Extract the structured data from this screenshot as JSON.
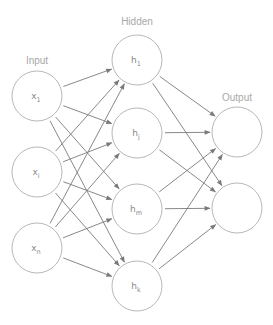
{
  "diagram": {
    "type": "neural-network",
    "colors": {
      "node_stroke": "#b8b8b8",
      "edge": "#7a7a7a",
      "label": "#a8a8a8"
    },
    "layers": [
      {
        "label": "Input",
        "label_pos": [
          37,
          64
        ],
        "nodes": [
          {
            "id": "x1",
            "base": "x",
            "sub": "1",
            "cx": 37,
            "cy": 96
          },
          {
            "id": "xi",
            "base": "x",
            "sub": "i",
            "cx": 37,
            "cy": 172
          },
          {
            "id": "xn",
            "base": "x",
            "sub": "n",
            "cx": 37,
            "cy": 248
          }
        ]
      },
      {
        "label": "Hidden",
        "label_pos": [
          137,
          25
        ],
        "nodes": [
          {
            "id": "h1",
            "base": "h",
            "sub": "1",
            "cx": 137,
            "cy": 60
          },
          {
            "id": "hj",
            "base": "h",
            "sub": "j",
            "cx": 137,
            "cy": 133
          },
          {
            "id": "hm",
            "base": "h",
            "sub": "m",
            "cx": 137,
            "cy": 209
          },
          {
            "id": "hk",
            "base": "h",
            "sub": "k",
            "cx": 137,
            "cy": 286
          }
        ]
      },
      {
        "label": "Output",
        "label_pos": [
          237,
          101
        ],
        "nodes": [
          {
            "id": "o1",
            "base": "",
            "sub": "",
            "cx": 237,
            "cy": 132
          },
          {
            "id": "o2",
            "base": "",
            "sub": "",
            "cx": 237,
            "cy": 208
          }
        ]
      }
    ],
    "node_radius": 25,
    "connections": "fully-connected between consecutive layers"
  }
}
